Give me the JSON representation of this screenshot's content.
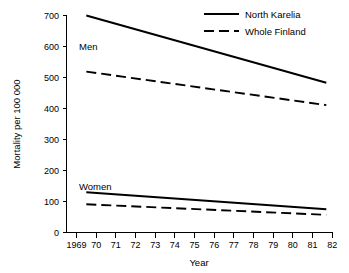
{
  "chart_data": {
    "type": "line",
    "title": "",
    "subtitle": "",
    "xlabel": "Year",
    "ylabel": "Mortality per 100 000",
    "xlim": [
      1969,
      1982
    ],
    "ylim": [
      0,
      700
    ],
    "grid": false,
    "legend_position": "top-right",
    "x_tick_labels": [
      "1969",
      "70",
      "71",
      "72",
      "73",
      "74",
      "75",
      "76",
      "77",
      "78",
      "79",
      "80",
      "81",
      "82"
    ],
    "x_tick_values": [
      1969,
      1970,
      1971,
      1972,
      1973,
      1974,
      1975,
      1976,
      1977,
      1978,
      1979,
      1980,
      1981,
      1982
    ],
    "y_tick_labels": [
      "0",
      "100",
      "200",
      "300",
      "400",
      "500",
      "600",
      "700"
    ],
    "y_tick_values": [
      0,
      100,
      200,
      300,
      400,
      500,
      600,
      700
    ],
    "annotations": [
      {
        "text": "Men",
        "x": 1970.0,
        "y": 600
      },
      {
        "text": "Women",
        "x": 1970.0,
        "y": 160
      }
    ],
    "series": [
      {
        "name": "North Karelia",
        "group": "Men",
        "style": "solid",
        "color": "#000000",
        "x": [
          1969.5,
          1981.7
        ],
        "values": [
          700,
          483
        ]
      },
      {
        "name": "Whole Finland",
        "group": "Men",
        "style": "dashed",
        "color": "#000000",
        "x": [
          1969.5,
          1981.7
        ],
        "values": [
          519,
          411
        ]
      },
      {
        "name": "North Karelia",
        "group": "Women",
        "style": "solid",
        "color": "#000000",
        "x": [
          1969.5,
          1981.7
        ],
        "values": [
          130,
          75
        ]
      },
      {
        "name": "Whole Finland",
        "group": "Women",
        "style": "dashed",
        "color": "#000000",
        "x": [
          1969.5,
          1981.7
        ],
        "values": [
          91,
          57
        ]
      }
    ]
  },
  "legend": {
    "entries": [
      {
        "label": "North Karelia",
        "style": "solid"
      },
      {
        "label": "Whole Finland",
        "style": "dashed"
      }
    ]
  },
  "axes": {
    "x_title": "Year",
    "y_title": "Mortality per 100 000"
  }
}
